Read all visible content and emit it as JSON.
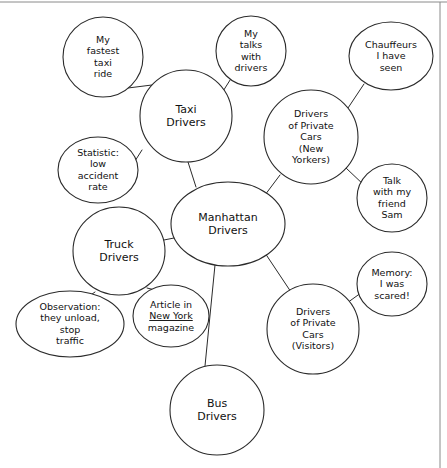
{
  "diagram": {
    "type": "mind-map",
    "title_node": "Manhattan Drivers",
    "background_color": "#ffffff",
    "line_color": "#2b2b2b",
    "text_color": "#111111",
    "frame_color": "#8a8a8a"
  },
  "nodes": [
    {
      "id": "manhattan-drivers",
      "role": "hub",
      "shape": "ellipse",
      "cx": 228,
      "cy": 224,
      "rx": 57,
      "ry": 42,
      "font_size": 11,
      "line_height": 13,
      "lines": [
        "Manhattan",
        "Drivers"
      ]
    },
    {
      "id": "taxi-drivers",
      "role": "category",
      "shape": "ellipse",
      "cx": 186,
      "cy": 116,
      "rx": 46,
      "ry": 46,
      "font_size": 11,
      "line_height": 13,
      "lines": [
        "Taxi",
        "Drivers"
      ]
    },
    {
      "id": "truck-drivers",
      "role": "category",
      "shape": "ellipse",
      "cx": 119,
      "cy": 251,
      "rx": 46,
      "ry": 44,
      "font_size": 11,
      "line_height": 13,
      "lines": [
        "Truck",
        "Drivers"
      ]
    },
    {
      "id": "bus-drivers",
      "role": "category",
      "shape": "ellipse",
      "cx": 217,
      "cy": 410,
      "rx": 47,
      "ry": 45,
      "font_size": 11,
      "line_height": 13,
      "lines": [
        "Bus",
        "Drivers"
      ]
    },
    {
      "id": "private-cars-new-yorkers",
      "role": "category",
      "shape": "ellipse",
      "cx": 311,
      "cy": 137,
      "rx": 47,
      "ry": 47,
      "font_size": 9.5,
      "line_height": 11.5,
      "lines": [
        "Drivers",
        "of Private",
        "Cars",
        "(New",
        "Yorkers)"
      ]
    },
    {
      "id": "private-cars-visitors",
      "role": "category",
      "shape": "ellipse",
      "cx": 313,
      "cy": 329,
      "rx": 46,
      "ry": 45,
      "font_size": 9.5,
      "line_height": 11.5,
      "lines": [
        "Drivers",
        "of Private",
        "Cars",
        "(Visitors)"
      ]
    },
    {
      "id": "my-fastest-taxi-ride",
      "role": "leaf",
      "shape": "ellipse",
      "cx": 103,
      "cy": 57,
      "rx": 40,
      "ry": 40,
      "font_size": 9.5,
      "line_height": 11.5,
      "lines": [
        "My",
        "fastest",
        "taxi",
        "ride"
      ]
    },
    {
      "id": "my-talks-with-drivers",
      "role": "leaf",
      "shape": "ellipse",
      "cx": 251,
      "cy": 51,
      "rx": 35,
      "ry": 35,
      "font_size": 9.5,
      "line_height": 11.5,
      "lines": [
        "My",
        "talks",
        "with",
        "drivers"
      ]
    },
    {
      "id": "statistic-low-accident-rate",
      "role": "leaf",
      "shape": "ellipse",
      "cx": 98,
      "cy": 170,
      "rx": 40,
      "ry": 33,
      "font_size": 9.5,
      "line_height": 11.5,
      "lines": [
        "Statistic:",
        "low",
        "accident",
        "rate"
      ]
    },
    {
      "id": "observation-they-unload",
      "role": "leaf",
      "shape": "ellipse",
      "cx": 70,
      "cy": 324,
      "rx": 54,
      "ry": 33,
      "font_size": 9.5,
      "line_height": 11.5,
      "lines": [
        "Observation:",
        "they unload,",
        "stop",
        "traffic"
      ]
    },
    {
      "id": "article-in-new-york-magazine",
      "role": "leaf",
      "shape": "ellipse",
      "cx": 171,
      "cy": 316,
      "rx": 38,
      "ry": 31,
      "font_size": 9.5,
      "line_height": 11.5,
      "lines": [
        "Article in",
        "New York",
        "magazine"
      ],
      "underline_line_index": 1
    },
    {
      "id": "chauffeurs-i-have-seen",
      "role": "leaf",
      "shape": "ellipse",
      "cx": 391,
      "cy": 56,
      "rx": 42,
      "ry": 34,
      "font_size": 9.5,
      "line_height": 11.5,
      "lines": [
        "Chauffeurs",
        "I have",
        "seen"
      ]
    },
    {
      "id": "talk-with-my-friend-sam",
      "role": "leaf",
      "shape": "ellipse",
      "cx": 392,
      "cy": 198,
      "rx": 35,
      "ry": 34,
      "font_size": 9.5,
      "line_height": 11.5,
      "lines": [
        "Talk",
        "with my",
        "friend",
        "Sam"
      ]
    },
    {
      "id": "memory-i-was-scared",
      "role": "leaf",
      "shape": "ellipse",
      "cx": 392,
      "cy": 284,
      "rx": 35,
      "ry": 32,
      "font_size": 9.5,
      "line_height": 11.5,
      "lines": [
        "Memory:",
        "I was",
        "scared!"
      ]
    }
  ],
  "edges": [
    {
      "id": "edge-hub-taxi",
      "from": "manhattan-drivers",
      "to": "taxi-drivers",
      "x1": 196,
      "y1": 187,
      "x2": 188,
      "y2": 162
    },
    {
      "id": "edge-hub-truck",
      "from": "manhattan-drivers",
      "to": "truck-drivers",
      "x1": 174,
      "y1": 238,
      "x2": 164,
      "y2": 240
    },
    {
      "id": "edge-hub-bus",
      "from": "manhattan-drivers",
      "to": "bus-drivers",
      "x1": 215,
      "y1": 265,
      "x2": 205,
      "y2": 366
    },
    {
      "id": "edge-hub-private-ny",
      "from": "manhattan-drivers",
      "to": "private-cars-new-yorkers",
      "x1": 262,
      "y1": 199,
      "x2": 280,
      "y2": 175
    },
    {
      "id": "edge-hub-private-visitors",
      "from": "manhattan-drivers",
      "to": "private-cars-visitors",
      "x1": 263,
      "y1": 250,
      "x2": 291,
      "y2": 292
    },
    {
      "id": "edge-taxi-fastest-ride",
      "from": "taxi-drivers",
      "to": "my-fastest-taxi-ride",
      "x1": 152,
      "y1": 85,
      "x2": 128,
      "y2": 88
    },
    {
      "id": "edge-taxi-my-talks",
      "from": "taxi-drivers",
      "to": "my-talks-with-drivers",
      "x1": 220,
      "y1": 96,
      "x2": 232,
      "y2": 77
    },
    {
      "id": "edge-taxi-statistic",
      "from": "taxi-drivers",
      "to": "statistic-low-accident-rate",
      "x1": 142,
      "y1": 150,
      "x2": 135,
      "y2": 161
    },
    {
      "id": "edge-truck-observation",
      "from": "truck-drivers",
      "to": "observation-they-unload",
      "x1": 95,
      "y1": 292,
      "x2": 85,
      "y2": 299
    },
    {
      "id": "edge-truck-article",
      "from": "truck-drivers",
      "to": "article-in-new-york-magazine",
      "x1": 147,
      "y1": 288,
      "x2": 159,
      "y2": 291
    },
    {
      "id": "edge-private-ny-chauffeurs",
      "from": "private-cars-new-yorkers",
      "to": "chauffeurs-i-have-seen",
      "x1": 346,
      "y1": 111,
      "x2": 364,
      "y2": 84
    },
    {
      "id": "edge-private-ny-talk-sam",
      "from": "private-cars-new-yorkers",
      "to": "talk-with-my-friend-sam",
      "x1": 346,
      "y1": 168,
      "x2": 365,
      "y2": 186
    },
    {
      "id": "edge-private-visitors-memory",
      "from": "private-cars-visitors",
      "to": "memory-i-was-scared",
      "x1": 347,
      "y1": 303,
      "x2": 365,
      "y2": 290
    }
  ],
  "frame": {
    "top_line": {
      "x1": 0,
      "y1": 2,
      "x2": 447,
      "y2": 2
    },
    "right_line": {
      "x1": 440,
      "y1": 2,
      "x2": 440,
      "y2": 468
    }
  }
}
